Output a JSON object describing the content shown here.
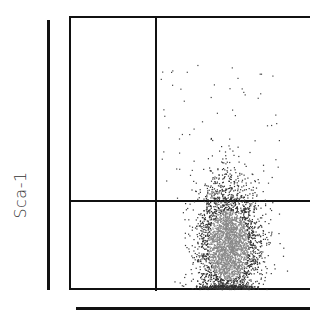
{
  "chart_data": {
    "type": "scatter",
    "title": "",
    "xlabel": "",
    "ylabel": "Sca-1",
    "quadrant_gates": {
      "vertical_x_px": 156,
      "horizontal_y_px": 201
    },
    "population": {
      "description": "Dense main population, mostly in lower-right quadrant, extending slightly above the horizontal gate",
      "center_px": [
        228,
        245
      ],
      "spread_px": [
        28,
        45
      ]
    },
    "grid": false,
    "legend": null
  },
  "axes": {
    "ylabel": "Sca-1"
  }
}
